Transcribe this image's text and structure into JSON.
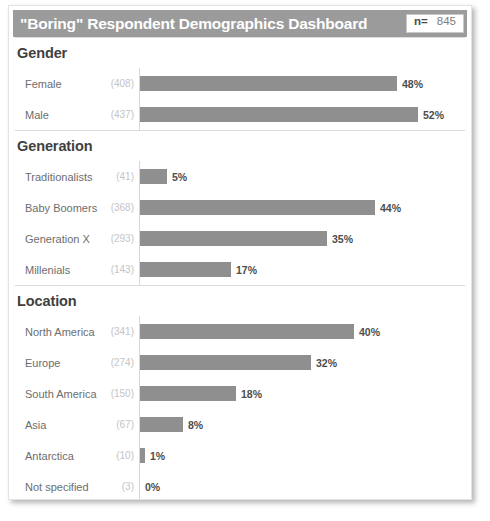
{
  "header": {
    "title": "\"Boring\" Respondent Demographics Dashboard",
    "n_label": "n=",
    "n_value": "845"
  },
  "colors": {
    "header_bg": "#9b9b9b",
    "bar": "#8f8f8f",
    "label": "#6d6d6d",
    "count": "#c4c4c4",
    "value": "#4d4d4d"
  },
  "chart_data": {
    "type": "bar",
    "title": "\"Boring\" Respondent Demographics Dashboard",
    "xlabel": "",
    "ylabel": "",
    "orientation": "horizontal",
    "grid": false,
    "legend": "none",
    "total_n": 845,
    "xlim": [
      0,
      60
    ],
    "sections": [
      {
        "title": "Gender",
        "categories": [
          "Female",
          "Male"
        ],
        "counts": [
          408,
          437
        ],
        "count_labels": [
          "(408)",
          "(437)"
        ],
        "values": [
          48,
          52
        ],
        "value_labels": [
          "48%",
          "52%"
        ]
      },
      {
        "title": "Generation",
        "categories": [
          "Traditionalists",
          "Baby Boomers",
          "Generation X",
          "Millenials"
        ],
        "counts": [
          41,
          368,
          293,
          143
        ],
        "count_labels": [
          "(41)",
          "(368)",
          "(293)",
          "(143)"
        ],
        "values": [
          5,
          44,
          35,
          17
        ],
        "value_labels": [
          "5%",
          "44%",
          "35%",
          "17%"
        ]
      },
      {
        "title": "Location",
        "categories": [
          "North America",
          "Europe",
          "South America",
          "Asia",
          "Antarctica",
          "Not specified"
        ],
        "counts": [
          341,
          274,
          150,
          67,
          10,
          3
        ],
        "count_labels": [
          "(341)",
          "(274)",
          "(150)",
          "(67)",
          "(10)",
          "(3)"
        ],
        "values": [
          40,
          32,
          18,
          8,
          1,
          0
        ],
        "value_labels": [
          "40%",
          "32%",
          "18%",
          "8%",
          "1%",
          "0%"
        ]
      }
    ]
  }
}
